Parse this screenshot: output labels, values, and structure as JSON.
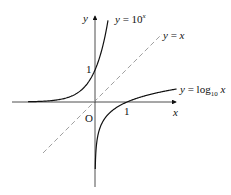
{
  "chart_data": {
    "type": "line",
    "title": "",
    "xlabel": "x",
    "ylabel": "y",
    "origin_label": "O",
    "tick_labels": {
      "x": [
        "1"
      ],
      "y": [
        "1"
      ]
    },
    "grid": false,
    "legend": "inline labels",
    "xlim": [
      -2.6,
      2.6
    ],
    "ylim": [
      -2.6,
      2.7
    ],
    "series": [
      {
        "name": "y = 10^x",
        "label_text": "y = 10",
        "label_sup": "x",
        "style": "solid",
        "x": [
          -2.0,
          -1.5,
          -1.0,
          -0.5,
          0.0,
          0.2,
          0.3,
          0.4
        ],
        "y": [
          0.01,
          0.032,
          0.1,
          0.316,
          1.0,
          1.585,
          1.995,
          2.512
        ]
      },
      {
        "name": "y = x",
        "label_text": "y = x",
        "style": "dashed",
        "x": [
          -1.6,
          2.1
        ],
        "y": [
          -1.6,
          2.1
        ]
      },
      {
        "name": "y = log10 x",
        "label_text": "y = log",
        "label_sub": "10",
        "label_tail": " x",
        "style": "solid",
        "x": [
          0.01,
          0.032,
          0.1,
          0.316,
          1.0,
          1.585,
          1.995,
          2.5
        ],
        "y": [
          -2.0,
          -1.5,
          -1.0,
          -0.5,
          0.0,
          0.2,
          0.3,
          0.398
        ]
      }
    ]
  }
}
